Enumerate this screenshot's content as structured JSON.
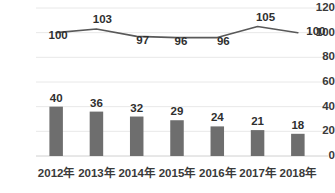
{
  "chart_data": {
    "type": "bar",
    "title": "",
    "subtitle": "",
    "xlabel": "",
    "ylabel": "",
    "ylim": [
      0,
      120
    ],
    "ytick_values": [
      0,
      20,
      40,
      60,
      80,
      100,
      120
    ],
    "ytick_labels": [
      "0",
      "20",
      "40",
      "60",
      "80",
      "100",
      "120"
    ],
    "grid": true,
    "legend": "none",
    "categories": [
      "2012年",
      "2013年",
      "2014年",
      "2015年",
      "2016年",
      "2017年",
      "2018年"
    ],
    "series": [
      {
        "name": "bars",
        "type": "bar",
        "color": "#6e6e6e",
        "values": [
          40,
          36,
          32,
          29,
          24,
          21,
          18
        ],
        "labels": [
          "40",
          "36",
          "32",
          "29",
          "24",
          "21",
          "18"
        ]
      },
      {
        "name": "line",
        "type": "line",
        "color": "#595959",
        "values": [
          100,
          103,
          97,
          96,
          96,
          105,
          100
        ],
        "labels": [
          "100",
          "103",
          "97",
          "96",
          "96",
          "105",
          "100"
        ]
      }
    ]
  },
  "style": {
    "background": "#ffffff",
    "grid_color": "#e8e8e8",
    "bar_color": "#6e6e6e",
    "line_color": "#595959",
    "text_color": "#3a3a3a"
  }
}
